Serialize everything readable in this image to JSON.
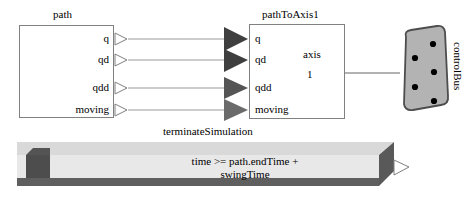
{
  "diagram": {
    "background": "#ffffff"
  },
  "colors": {
    "block_border": "#808080",
    "block_fill": "#ffffff",
    "connection_line": "#999999",
    "port_in_fill": "#3f3f3f",
    "port_out_fill": "#ffffff",
    "bus_fill": "#b3b3b3",
    "bus_border": "#4d4d4d",
    "bus_dot": "#000000",
    "term_top_face": "#d9d9d9",
    "term_front_face": "#e8e8e8",
    "term_side_face": "#595959",
    "term_bottom_face": "#595959",
    "term_inner_square": "#4d4d4d",
    "signal_curve": "#999999"
  },
  "blocks": {
    "path": {
      "name": "path",
      "title": "path",
      "outputs": [
        {
          "label": "q"
        },
        {
          "label": "qd"
        },
        {
          "label": "qdd"
        },
        {
          "label": "moving"
        }
      ],
      "icon": "signal-waveform-icon"
    },
    "pathToAxis1": {
      "name": "pathToAxis1",
      "title": "pathToAxis1",
      "inputs": [
        {
          "label": "q"
        },
        {
          "label": "qd"
        },
        {
          "label": "qdd"
        },
        {
          "label": "moving"
        }
      ],
      "axis_label": "axis",
      "axis_index": "1",
      "connector": "axis-bus-connector"
    },
    "controlBus": {
      "name": "controlBus",
      "title": "controlBus",
      "dot_count": 5,
      "icon": "bus-connector-icon"
    },
    "terminateSimulation": {
      "name": "terminateSimulation",
      "title": "terminateSimulation",
      "condition_line1": "time >= path.endTime +",
      "condition_line2": "swingTime",
      "condition": "time >= path.endTime + swingTime"
    }
  },
  "connections": [
    {
      "from": "path.q",
      "to": "pathToAxis1.q"
    },
    {
      "from": "path.qd",
      "to": "pathToAxis1.qd"
    },
    {
      "from": "path.qdd",
      "to": "pathToAxis1.qdd"
    },
    {
      "from": "path.moving",
      "to": "pathToAxis1.moving"
    },
    {
      "from": "pathToAxis1.axis",
      "to": "controlBus"
    }
  ]
}
